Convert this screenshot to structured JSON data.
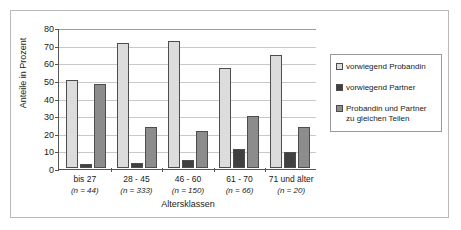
{
  "chart_data": {
    "type": "bar",
    "title": "",
    "xlabel": "Altersklassen",
    "ylabel": "Anteile in Prozent",
    "ylim": [
      0,
      80
    ],
    "ytick_step": 10,
    "yticks": [
      80,
      70,
      60,
      50,
      40,
      30,
      20,
      10,
      0
    ],
    "grid": true,
    "legend_position": "right",
    "categories": [
      {
        "label": "bis 27",
        "n_label": "(n = 44)",
        "n": 44
      },
      {
        "label": "28 - 45",
        "n_label": "(n = 333)",
        "n": 333
      },
      {
        "label": "46 - 60",
        "n_label": "(n = 150)",
        "n": 150
      },
      {
        "label": "61 - 70",
        "n_label": "(n = 66)",
        "n": 66
      },
      {
        "label": "71 und älter",
        "n_label": "(n = 20)",
        "n": 20
      }
    ],
    "series": [
      {
        "name": "vorwiegend Probandin",
        "color": "#dcdcdc",
        "values": [
          50,
          71,
          72,
          57,
          64
        ]
      },
      {
        "name": "vorwiegend Partner",
        "color": "#404040",
        "values": [
          2,
          3,
          4.5,
          11,
          9
        ]
      },
      {
        "name": "Probandin und Partner zu gleichen Teilen",
        "color": "#8c8c8c",
        "values": [
          47.5,
          23.5,
          21,
          29.5,
          23.5
        ]
      }
    ]
  },
  "legend": {
    "entries": [
      {
        "label": "vorwiegend Probandin"
      },
      {
        "label": "vorwiegend Partner"
      },
      {
        "label": "Probandin und Partner zu gleichen Teilen"
      }
    ]
  }
}
